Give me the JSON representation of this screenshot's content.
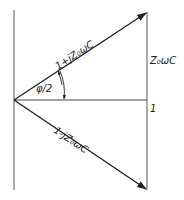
{
  "diagram": {
    "type": "phasor-diagram",
    "labels": {
      "upper_vector": "1+jZ₀ωC",
      "lower_vector": "1-jZ₀ωC",
      "vertical_side": "Z₀ωC",
      "horizontal_side": "1",
      "angle": "φ/2"
    },
    "colors": {
      "line": "#222222",
      "background": "#ffffff"
    }
  }
}
